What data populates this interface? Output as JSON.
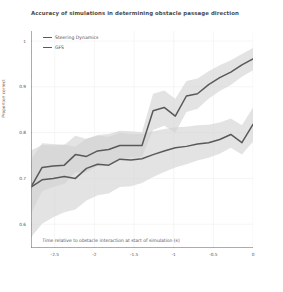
{
  "chart_data": {
    "type": "line",
    "title": "Accuracy of simulations in determining obstacle passage direction",
    "xlabel": "Time relative to obstacle interaction at start of simulation (s)",
    "ylabel": "Proportion correct",
    "xlim": [
      -2.8,
      0.0
    ],
    "ylim": [
      0.548,
      1.022
    ],
    "xticks": [
      -2.5,
      -2,
      -1.5,
      -1,
      -0.5,
      0
    ],
    "xtick_labels": [
      "-2.5",
      "-2",
      "-1.5",
      "-1",
      "-0.5",
      "0"
    ],
    "yticks": [
      0.6,
      0.7,
      0.8,
      0.9,
      1.0
    ],
    "ytick_labels": [
      "0.6",
      "0.7",
      "0.8",
      "0.9",
      "1"
    ],
    "grid": true,
    "grid_color": "#f2f2f2",
    "legend_position": "upper left",
    "band_type": "confidence interval",
    "x": [
      -2.8,
      -2.66,
      -2.52,
      -2.38,
      -2.24,
      -2.1,
      -1.96,
      -1.82,
      -1.68,
      -1.54,
      -1.4,
      -1.26,
      -1.12,
      -0.98,
      -0.84,
      -0.7,
      -0.56,
      -0.42,
      -0.28,
      -0.14,
      0.0
    ],
    "series": [
      {
        "name": "Steering Dynamics",
        "color": "#595959",
        "band_color": "#d2d2d2",
        "values": [
          0.681,
          0.724,
          0.727,
          0.729,
          0.752,
          0.748,
          0.76,
          0.763,
          0.772,
          0.772,
          0.772,
          0.848,
          0.855,
          0.836,
          0.88,
          0.885,
          0.905,
          0.92,
          0.932,
          0.948,
          0.961
        ],
        "band_lower": [
          0.623,
          0.672,
          0.681,
          0.688,
          0.713,
          0.713,
          0.727,
          0.731,
          0.742,
          0.745,
          0.747,
          0.806,
          0.815,
          0.8,
          0.845,
          0.852,
          0.874,
          0.891,
          0.904,
          0.922,
          0.936
        ],
        "band_upper": [
          0.742,
          0.777,
          0.775,
          0.773,
          0.793,
          0.786,
          0.795,
          0.797,
          0.804,
          0.803,
          0.801,
          0.885,
          0.892,
          0.874,
          0.913,
          0.918,
          0.934,
          0.947,
          0.958,
          0.972,
          0.985
        ]
      },
      {
        "name": "GFS",
        "color": "#595959",
        "band_color": "#d2d2d2",
        "values": [
          0.681,
          0.697,
          0.7,
          0.704,
          0.7,
          0.722,
          0.731,
          0.729,
          0.742,
          0.74,
          0.743,
          0.752,
          0.76,
          0.767,
          0.77,
          0.775,
          0.778,
          0.785,
          0.796,
          0.778,
          0.818
        ],
        "band_lower": [
          0.571,
          0.601,
          0.615,
          0.626,
          0.632,
          0.652,
          0.663,
          0.667,
          0.681,
          0.683,
          0.69,
          0.703,
          0.714,
          0.724,
          0.731,
          0.739,
          0.745,
          0.754,
          0.767,
          0.752,
          0.78
        ],
        "band_upper": [
          0.761,
          0.773,
          0.772,
          0.774,
          0.769,
          0.787,
          0.793,
          0.791,
          0.8,
          0.797,
          0.797,
          0.803,
          0.808,
          0.812,
          0.813,
          0.816,
          0.817,
          0.822,
          0.831,
          0.816,
          0.855
        ]
      }
    ]
  },
  "legend": {
    "items": [
      {
        "label": "Steering Dynamics",
        "color": "#595959"
      },
      {
        "label": "GFS",
        "color": "#595959"
      }
    ]
  },
  "axis": {
    "spine_color": "#8a8a8a"
  }
}
